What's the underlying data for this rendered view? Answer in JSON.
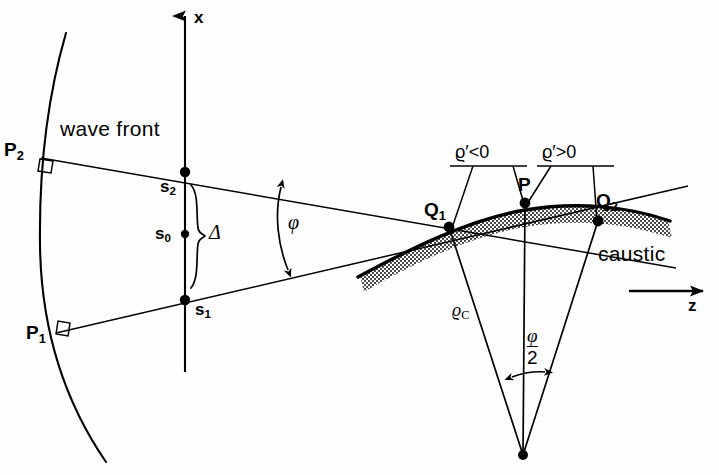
{
  "figure": {
    "background_color": "#fefefe",
    "ink_color": "#000000",
    "shading_color": "#8a8a8a",
    "width": 719,
    "height": 475
  },
  "axes": {
    "x_axis_label": "x",
    "z_axis_label": "z"
  },
  "labels": {
    "wave_front": "wave front",
    "caustic": "caustic",
    "P2": "P",
    "P2_sub": "2",
    "P1": "P",
    "P1_sub": "1",
    "s2": "s",
    "s2_sub": "2",
    "s0": "s",
    "s0_sub": "0",
    "s1": "s",
    "s1_sub": "1",
    "Q1": "Q",
    "Q1_sub": "1",
    "Q2": "Q",
    "Q2_sub": "2",
    "P": "P",
    "delta": "Δ",
    "phi": "φ",
    "rho_c": "ϱ",
    "rho_c_sub": "C",
    "rho_prime_neg": "ϱ′<0",
    "rho_prime_pos": "ϱ′>0",
    "phi_half_num": "φ",
    "phi_half_den": "2"
  },
  "points": {
    "P2": {
      "x": 41,
      "y": 158
    },
    "P1": {
      "x": 56,
      "y": 333
    },
    "s2": {
      "x": 185,
      "y": 172
    },
    "s0": {
      "x": 185,
      "y": 234
    },
    "s1": {
      "x": 185,
      "y": 300
    },
    "Q1": {
      "x": 449,
      "y": 227
    },
    "P": {
      "x": 525,
      "y": 203
    },
    "Q2": {
      "x": 598,
      "y": 221
    },
    "C": {
      "x": 523,
      "y": 455
    }
  },
  "annotations": {
    "brace_label": "Δ",
    "angle_at_apex": "φ/2",
    "angle_between_rays": "φ",
    "radius_of_curvature": "ϱ_C",
    "left_branch_sign": "ϱ′<0",
    "right_branch_sign": "ϱ′>0"
  }
}
